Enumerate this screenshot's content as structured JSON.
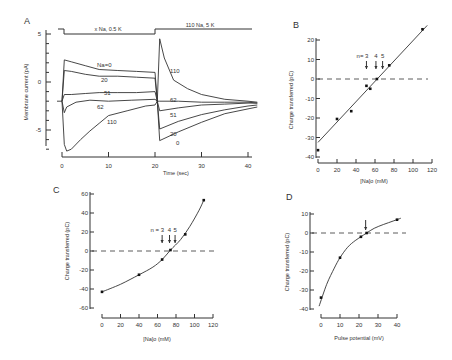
{
  "chart_data": [
    {
      "panel": "A",
      "type": "line",
      "title": "",
      "xlabel": "Time (sec)",
      "ylabel": "Membrane current (pA)",
      "xlim": [
        0,
        42
      ],
      "ylim": [
        -7.5,
        5
      ],
      "xticks": [
        0,
        10,
        20,
        30,
        40
      ],
      "yticks": [
        5,
        0,
        -5
      ],
      "grid": false,
      "protocol": [
        {
          "label": "x Na, 0.5 K",
          "x_start": 0,
          "x_end": 20
        },
        {
          "label": "110 Na, 5 K",
          "x_start": 20,
          "x_end": 42
        }
      ],
      "series": [
        {
          "name": "Na=0",
          "label": "Na=0",
          "x": [
            0,
            0.5,
            2,
            5,
            8,
            12,
            16,
            20,
            20.5,
            21,
            25,
            30,
            35,
            40,
            42
          ],
          "values": [
            -2,
            2.3,
            2.1,
            1.7,
            1.3,
            1.2,
            1.1,
            1.0,
            -2,
            -6.1,
            -5.2,
            -4.2,
            -3.3,
            -2.8,
            -2.6
          ]
        },
        {
          "name": "20",
          "label": "20",
          "x": [
            0,
            0.5,
            2,
            5,
            8,
            12,
            16,
            20,
            20.5,
            21,
            25,
            30,
            35,
            40,
            42
          ],
          "values": [
            -2,
            1.2,
            1.1,
            0.8,
            0.6,
            0.6,
            0.5,
            0.4,
            -2,
            -4.9,
            -4.1,
            -3.4,
            -2.9,
            -2.5,
            -2.4
          ]
        },
        {
          "name": "51",
          "label": "51",
          "x": [
            0,
            0.5,
            2,
            5,
            8,
            12,
            16,
            20,
            20.5,
            21,
            25,
            30,
            35,
            40,
            42
          ],
          "values": [
            -2,
            -1.3,
            -1.3,
            -1.2,
            -1.1,
            -1.1,
            -1.1,
            -1.0,
            -2,
            -3.0,
            -2.7,
            -2.4,
            -2.3,
            -2.2,
            -2.2
          ]
        },
        {
          "name": "62",
          "label": "62",
          "x": [
            0,
            0.5,
            1,
            3,
            6,
            10,
            15,
            20,
            20.5,
            21,
            25,
            30,
            35,
            40,
            42
          ],
          "values": [
            -2,
            -3.2,
            -2.6,
            -2.1,
            -1.9,
            -2.0,
            -1.9,
            -1.8,
            -2,
            -2.0,
            -2.0,
            -2.1,
            -2.1,
            -2.1,
            -2.2
          ]
        },
        {
          "name": "110",
          "label": "110",
          "x": [
            0,
            0.5,
            1,
            2,
            4,
            6,
            8,
            10,
            14,
            18,
            20,
            20.5,
            21,
            22,
            24,
            27,
            30,
            35,
            40,
            42
          ],
          "values": [
            -2,
            -6.5,
            -7.2,
            -7.0,
            -6.0,
            -5.1,
            -4.3,
            -3.5,
            -3.0,
            -2.5,
            -2.4,
            -2,
            4.5,
            2.5,
            0.2,
            -0.7,
            -1.3,
            -1.8,
            -2.0,
            -2.1
          ]
        }
      ]
    },
    {
      "panel": "B",
      "type": "scatter",
      "title": "",
      "xlabel": "[Na]o (mM)",
      "ylabel": "Charge transferred (pC)",
      "xlim": [
        0,
        120
      ],
      "ylim": [
        -40,
        25
      ],
      "xticks": [
        0,
        20,
        40,
        60,
        80,
        100,
        120
      ],
      "yticks": [
        20,
        10,
        0,
        -10,
        -20,
        -30,
        -40
      ],
      "grid": false,
      "reference_line_y": 0,
      "points": {
        "x": [
          0,
          20,
          35,
          51,
          55,
          62,
          75,
          110
        ],
        "values": [
          -36.5,
          -20.5,
          -16.5,
          -3.5,
          -5,
          0,
          7,
          25.5
        ]
      },
      "fit_line": {
        "x": [
          0,
          115
        ],
        "values": [
          -32.5,
          27.5
        ]
      },
      "arrows": [
        {
          "label": "n= 3",
          "x": 51
        },
        {
          "label": "4",
          "x": 61
        },
        {
          "label": "5",
          "x": 68
        }
      ]
    },
    {
      "panel": "C",
      "type": "scatter",
      "title": "",
      "xlabel": "[Na]o (mM)",
      "ylabel": "Charge transferred (pC)",
      "xlim": [
        0,
        120
      ],
      "ylim": [
        -60,
        60
      ],
      "xticks": [
        0,
        20,
        40,
        60,
        80,
        100,
        120
      ],
      "yticks": [
        60,
        40,
        20,
        0,
        -20,
        -40,
        -60
      ],
      "grid": false,
      "reference_line_y": 0,
      "points": {
        "x": [
          0,
          40,
          65,
          74,
          90,
          110
        ],
        "values": [
          -43,
          -25,
          -9,
          1,
          17.5,
          53.5
        ]
      },
      "fit_curve": {
        "x": [
          0,
          20,
          40,
          55,
          65,
          74,
          85,
          95,
          105,
          110
        ],
        "values": [
          -43,
          -35,
          -25,
          -17,
          -9,
          1,
          12,
          26,
          43,
          53.5
        ]
      },
      "arrows": [
        {
          "label": "n = 3",
          "x": 65
        },
        {
          "label": "4",
          "x": 73
        },
        {
          "label": "5",
          "x": 79
        }
      ]
    },
    {
      "panel": "D",
      "type": "scatter",
      "title": "",
      "xlabel": "Pulse potential (mV)",
      "ylabel": "Charge transferred (pC)",
      "xlim": [
        0,
        40
      ],
      "ylim": [
        -40,
        10
      ],
      "xticks": [
        0,
        10,
        20,
        30,
        40
      ],
      "yticks": [
        10,
        0,
        -10,
        -20,
        -30,
        -40
      ],
      "grid": false,
      "reference_line_y": 0,
      "points": {
        "x": [
          0,
          10,
          21,
          24,
          40
        ],
        "values": [
          -34,
          -13,
          -2,
          0,
          7
        ]
      },
      "fit_curve": {
        "x": [
          -1,
          3,
          7,
          10,
          14,
          18,
          21,
          24,
          28,
          33,
          38,
          42
        ],
        "values": [
          -38.5,
          -27,
          -18.5,
          -13,
          -7.5,
          -4,
          -2,
          0,
          2.5,
          4.5,
          6.3,
          7.8
        ]
      },
      "arrows": [
        {
          "label": "",
          "x": 23.5
        }
      ]
    }
  ],
  "panels": {
    "A": {
      "letter": "A",
      "protocol_left": "x Na, 0.5 K",
      "protocol_right": "110 Na, 5 K",
      "ylabel": "Membrane current (pA)",
      "xlabel": "Time  (sec)"
    },
    "B": {
      "letter": "B",
      "ylabel": "Charge transferred (pC)",
      "xlabel": "[Na]o (mM)"
    },
    "C": {
      "letter": "C",
      "ylabel": "Charge transferred (pC)",
      "xlabel": "[Na]o (mM)"
    },
    "D": {
      "letter": "D",
      "ylabel": "Charge transferred (pC)",
      "xlabel": "Pulse potential (mV)"
    }
  }
}
